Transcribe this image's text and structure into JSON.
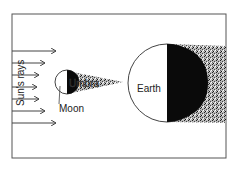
{
  "diagram": {
    "labels": {
      "sun_rays": "Sun's rays",
      "moon": "Moon",
      "umbra": "Umbra",
      "earth": "Earth"
    },
    "colors": {
      "line": "#444444",
      "shadow": "#0a0a0a",
      "penumbra": "#9a9a9a",
      "background": "#ffffff"
    }
  }
}
